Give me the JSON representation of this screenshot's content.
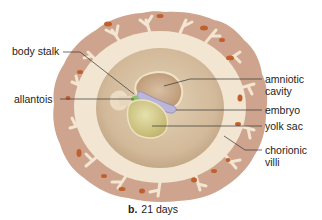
{
  "figure": {
    "caption_letter": "b.",
    "caption_text": "21 days"
  },
  "labels": {
    "body_stalk": "body stalk",
    "allantois": "allantois",
    "amniotic_cavity_1": "amniotic",
    "amniotic_cavity_2": "cavity",
    "embryo": "embryo",
    "yolk_sac": "yolk sac",
    "chorionic_villi_1": "chorionic",
    "chorionic_villi_2": "villi"
  },
  "colors": {
    "outer_tissue": "#cfa58f",
    "chorion_ring": "#f3e6d2",
    "chorionic_cavity": "#d6c0a3",
    "amnion": "#c9a98a",
    "embryo": "#b8b4d8",
    "yolk_sac": "#d8d29a",
    "allantois": "#8cc06a",
    "blood_spots": "#c0602e",
    "leader_lines": "#333333"
  }
}
